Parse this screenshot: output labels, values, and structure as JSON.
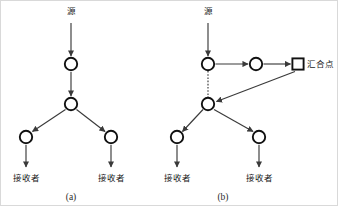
{
  "figure": {
    "colors": {
      "background": "#ffffff",
      "stroke": "#111111",
      "edge": "#3a3a3a",
      "frame": "#d9d9d9",
      "text": "#1a1a1a"
    },
    "labels": {
      "source": "源",
      "receiver": "接收者",
      "rendezvous_point": "汇合点"
    },
    "panels": [
      {
        "id": "a",
        "caption": "(a)",
        "caption_x": 70,
        "caption_y": 196,
        "source_label": "源",
        "source_label_x": 70,
        "source_label_y": 13,
        "nodes": [
          {
            "name": "node-a-top",
            "shape": "circle",
            "x": 70,
            "y": 63,
            "r": 6.2
          },
          {
            "name": "node-a-middle",
            "shape": "circle",
            "x": 70,
            "y": 103,
            "r": 6.2
          },
          {
            "name": "node-a-left-branch",
            "shape": "circle",
            "x": 25,
            "y": 136,
            "r": 6.2
          },
          {
            "name": "node-a-right-branch",
            "shape": "circle",
            "x": 110,
            "y": 136,
            "r": 6.2
          }
        ],
        "receivers": [
          {
            "name": "receiver-a-left",
            "label": "接收者",
            "x": 25,
            "y": 177
          },
          {
            "name": "receiver-a-right",
            "label": "接收者",
            "x": 110,
            "y": 177
          }
        ],
        "edges": [
          {
            "name": "edge-a-source-to-top",
            "style": "solid",
            "x1": 70,
            "y1": 22,
            "x2": 70,
            "y2": 55
          },
          {
            "name": "edge-a-top-to-middle",
            "style": "solid",
            "x1": 70,
            "y1": 71,
            "x2": 70,
            "y2": 95
          },
          {
            "name": "edge-a-middle-to-left-branch",
            "style": "solid",
            "x1": 64,
            "y1": 109,
            "x2": 32,
            "y2": 130
          },
          {
            "name": "edge-a-middle-to-right-branch",
            "style": "solid",
            "x1": 76,
            "y1": 109,
            "x2": 104,
            "y2": 130
          },
          {
            "name": "edge-a-left-branch-to-receiver",
            "style": "solid",
            "x1": 25,
            "y1": 144,
            "x2": 25,
            "y2": 166
          },
          {
            "name": "edge-a-right-branch-to-receiver",
            "style": "solid",
            "x1": 110,
            "y1": 144,
            "x2": 110,
            "y2": 166
          }
        ]
      },
      {
        "id": "b",
        "caption": "(b)",
        "caption_x": 222,
        "caption_y": 196,
        "source_label": "源",
        "source_label_x": 207,
        "source_label_y": 13,
        "rp_label": "汇合点",
        "rp_label_x": 312,
        "rp_label_y": 66,
        "nodes": [
          {
            "name": "node-b-top",
            "shape": "circle",
            "x": 207,
            "y": 63,
            "r": 6.2
          },
          {
            "name": "node-b-relay",
            "shape": "circle",
            "x": 255,
            "y": 63,
            "r": 6.2
          },
          {
            "name": "node-b-rendezvous",
            "shape": "square",
            "x": 297,
            "y": 63,
            "r": 5.6
          },
          {
            "name": "node-b-middle",
            "shape": "circle",
            "x": 207,
            "y": 103,
            "r": 6.2
          },
          {
            "name": "node-b-left-branch",
            "shape": "circle",
            "x": 176,
            "y": 136,
            "r": 6.2
          },
          {
            "name": "node-b-right-branch",
            "shape": "circle",
            "x": 258,
            "y": 136,
            "r": 6.2
          }
        ],
        "receivers": [
          {
            "name": "receiver-b-left",
            "label": "接收者",
            "x": 176,
            "y": 177
          },
          {
            "name": "receiver-b-right",
            "label": "接收者",
            "x": 258,
            "y": 177
          }
        ],
        "edges": [
          {
            "name": "edge-b-source-to-top",
            "style": "solid",
            "x1": 207,
            "y1": 22,
            "x2": 207,
            "y2": 55
          },
          {
            "name": "edge-b-top-to-relay",
            "style": "solid",
            "x1": 215,
            "y1": 63,
            "x2": 247,
            "y2": 63
          },
          {
            "name": "edge-b-relay-to-rendezvous",
            "style": "solid",
            "x1": 263,
            "y1": 63,
            "x2": 290,
            "y2": 63
          },
          {
            "name": "edge-b-top-to-middle-dotted",
            "style": "dotted",
            "x1": 207,
            "y1": 71,
            "x2": 207,
            "y2": 95
          },
          {
            "name": "edge-b-rendezvous-to-middle",
            "style": "solid",
            "x1": 293,
            "y1": 70,
            "x2": 215,
            "y2": 100
          },
          {
            "name": "edge-b-middle-to-left-branch",
            "style": "solid",
            "x1": 202,
            "y1": 109,
            "x2": 182,
            "y2": 130
          },
          {
            "name": "edge-b-middle-to-right-branch",
            "style": "solid",
            "x1": 213,
            "y1": 109,
            "x2": 252,
            "y2": 130
          },
          {
            "name": "edge-b-left-branch-to-receiver",
            "style": "solid",
            "x1": 176,
            "y1": 144,
            "x2": 176,
            "y2": 166
          },
          {
            "name": "edge-b-right-branch-to-receiver",
            "style": "solid",
            "x1": 258,
            "y1": 144,
            "x2": 258,
            "y2": 166
          }
        ]
      }
    ]
  }
}
